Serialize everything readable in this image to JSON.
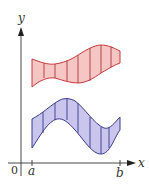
{
  "figure": {
    "type": "area-between-curves",
    "axes": {
      "x_label": "x",
      "y_label": "y",
      "origin_label": "0",
      "x_ticks": [
        "a",
        "b"
      ]
    },
    "regions": [
      {
        "name": "upper-region",
        "fill": "#f6c6c4",
        "stroke": "#c8393b",
        "vertical_strips": 7
      },
      {
        "name": "lower-region",
        "fill": "#c9c5ec",
        "stroke": "#3b3a8c",
        "vertical_strips": 7
      }
    ],
    "axis_color": "#333333"
  }
}
